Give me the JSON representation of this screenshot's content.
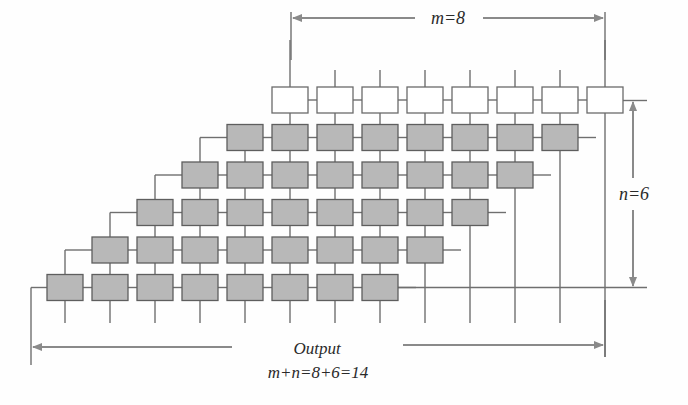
{
  "figure": {
    "type": "systolic-array-multiplier",
    "m": 8,
    "n": 6,
    "labels": {
      "m_dim": "m=8",
      "n_dim": "n=6",
      "output": "Output",
      "output_formula": "m+n=8+6=14"
    },
    "colors": {
      "line": "#6f6f6f",
      "gray_cell_fill": "#b8b8b8",
      "gray_cell_stroke": "#5e5e5e",
      "white_cell_fill": "#ffffff",
      "white_cell_stroke": "#6a6a6a",
      "arrow": "#8a8a8a",
      "text": "#2a2a2a"
    },
    "grid": {
      "cell_width": 36,
      "cell_height": 26,
      "column_pitch": 45,
      "row_pitch": 37.5,
      "top_row_x": 272,
      "top_row_y": 87,
      "rows": [
        {
          "index": 0,
          "kind": "white",
          "cells": 8
        },
        {
          "index": 1,
          "kind": "gray",
          "cells": 8
        },
        {
          "index": 2,
          "kind": "gray",
          "cells": 8
        },
        {
          "index": 3,
          "kind": "gray",
          "cells": 8
        },
        {
          "index": 4,
          "kind": "gray",
          "cells": 8
        },
        {
          "index": 5,
          "kind": "gray",
          "cells": 8
        }
      ]
    }
  }
}
